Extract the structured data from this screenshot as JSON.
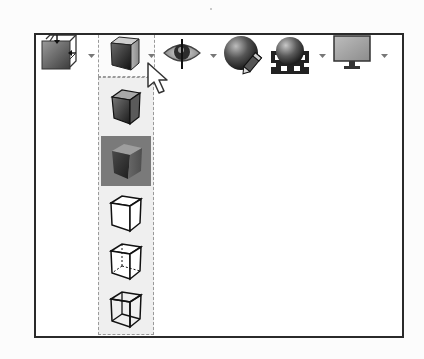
{
  "toolbar": {
    "buttons": [
      {
        "name": "view-orientation",
        "icon": "view-orientation-cube-icon",
        "has_dropdown": true
      },
      {
        "name": "display-style",
        "icon": "shaded-with-edges-cube-icon",
        "has_dropdown": true,
        "dropdown_open": true
      },
      {
        "name": "hide-show-items",
        "icon": "eye-icon",
        "has_dropdown": true
      },
      {
        "name": "edit-appearance",
        "icon": "sphere-pencil-icon",
        "has_dropdown": true
      },
      {
        "name": "apply-scene",
        "icon": "sphere-checkered-floor-icon",
        "has_dropdown": true
      },
      {
        "name": "view-settings",
        "icon": "monitor-icon",
        "has_dropdown": true
      }
    ]
  },
  "dropdown": {
    "for": "display-style",
    "items": [
      {
        "name": "shaded-with-edges",
        "icon": "shaded-with-edges-cube-icon",
        "selected": false
      },
      {
        "name": "shaded",
        "icon": "shaded-cube-icon",
        "selected": true
      },
      {
        "name": "hidden-lines-removed",
        "icon": "hidden-lines-removed-cube-icon",
        "selected": false
      },
      {
        "name": "hidden-lines-visible",
        "icon": "hidden-lines-visible-cube-icon",
        "selected": false
      },
      {
        "name": "wireframe",
        "icon": "wireframe-cube-icon",
        "selected": false
      }
    ]
  },
  "cursor": {
    "type": "arrow-pointer",
    "x": 147,
    "y": 62
  },
  "colors": {
    "frame_border": "#2a2a2a",
    "menu_background": "#efefef",
    "selected_item": "#7a7a7a",
    "background": "#ffffff"
  }
}
